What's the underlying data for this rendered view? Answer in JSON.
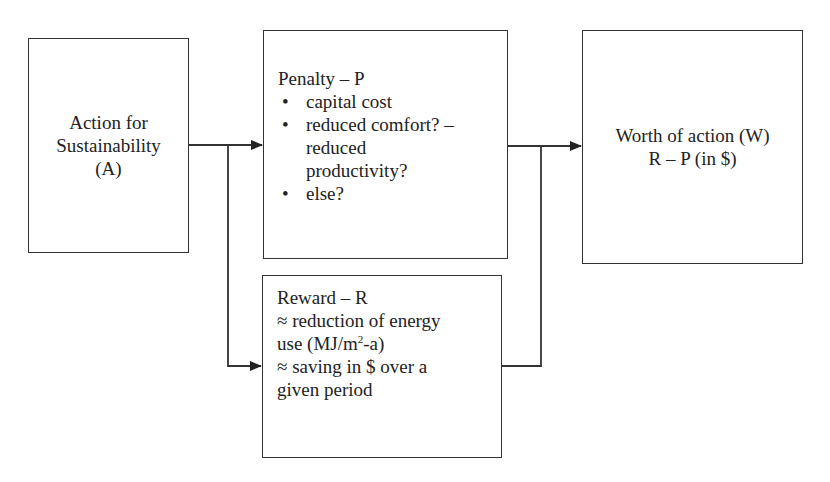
{
  "diagram": {
    "nodes": {
      "action": {
        "lines": [
          "Action for",
          "Sustainability",
          "(A)"
        ]
      },
      "penalty": {
        "title": "Penalty  – P",
        "bullets": [
          "capital cost",
          "reduced comfort? –",
          "reduced",
          "productivity?",
          "else?"
        ]
      },
      "reward": {
        "title": "Reward – R",
        "line1": "≈ reduction of energy",
        "line2_pre": "use (MJ/m",
        "line2_sup": "2",
        "line2_post": "-a)",
        "line3": "≈ saving in $ over a",
        "line4": "given period"
      },
      "worth": {
        "lines": [
          "Worth of action (W)",
          "R – P (in $)"
        ]
      }
    },
    "edges": [
      {
        "from": "action",
        "to": "penalty"
      },
      {
        "from": "action",
        "to": "reward"
      },
      {
        "from": "penalty",
        "to": "worth"
      },
      {
        "from": "reward",
        "to": "worth"
      }
    ],
    "colors": {
      "stroke": "#333333",
      "text": "#222222",
      "background": "#ffffff"
    }
  }
}
